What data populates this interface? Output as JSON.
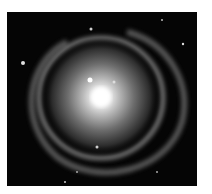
{
  "image": {
    "subject": "spiral galaxy",
    "colors": {
      "background": "#ffffff",
      "sky": "#050505",
      "core": "#ffffff",
      "arms": "#9a9a9a"
    }
  }
}
